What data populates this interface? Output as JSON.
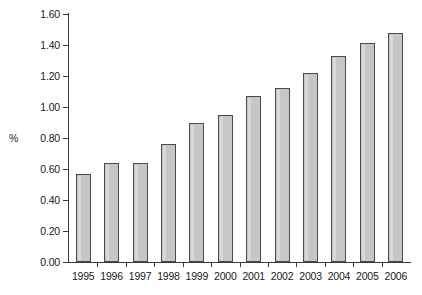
{
  "chart_data": {
    "type": "bar",
    "title": "",
    "subtitle": "",
    "xlabel": "",
    "ylabel": "%",
    "categories": [
      "1995",
      "1996",
      "1997",
      "1998",
      "1999",
      "2000",
      "2001",
      "2002",
      "2003",
      "2004",
      "2005",
      "2006"
    ],
    "values": [
      0.57,
      0.64,
      0.64,
      0.76,
      0.9,
      0.95,
      1.07,
      1.12,
      1.22,
      1.33,
      1.41,
      1.48
    ],
    "ylim": [
      0.0,
      1.6
    ],
    "ytick_step": 0.2,
    "ytick_labels": [
      "0.00",
      "0.20",
      "0.40",
      "0.60",
      "0.80",
      "1.00",
      "1.20",
      "1.40",
      "1.60"
    ],
    "ytick_values": [
      0.0,
      0.2,
      0.4,
      0.6,
      0.8,
      1.0,
      1.2,
      1.4,
      1.6
    ],
    "grid": false,
    "legend": null,
    "legend_position": "none",
    "annotations": [],
    "series": [
      {
        "name": "",
        "values": [
          0.57,
          0.64,
          0.64,
          0.76,
          0.9,
          0.95,
          1.07,
          1.12,
          1.22,
          1.33,
          1.41,
          1.48
        ]
      }
    ],
    "colors": {
      "bar_fill": "#c6c6c6",
      "bar_border": "#4a4a4a",
      "axis": "#3a3a3a",
      "text": "#1a1a1a",
      "background": "#ffffff"
    }
  }
}
